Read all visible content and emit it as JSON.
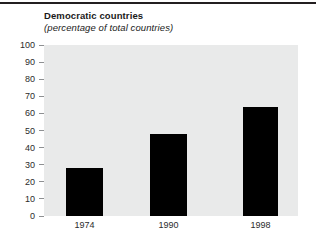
{
  "chart_data": {
    "type": "bar",
    "title": "Democratic countries",
    "subtitle": "(percentage of total countries)",
    "xlabel": "",
    "ylabel": "",
    "categories": [
      "1974",
      "1990",
      "1998"
    ],
    "values": [
      28,
      48,
      64
    ],
    "series": [
      {
        "name": "Democratic countries",
        "values": [
          28,
          48,
          64
        ]
      }
    ],
    "ylim": [
      0,
      100
    ],
    "yticks": [
      0,
      10,
      20,
      30,
      40,
      50,
      60,
      70,
      80,
      90,
      100
    ],
    "ytick_labels": [
      "0",
      "10",
      "20",
      "30",
      "40",
      "50",
      "60",
      "70",
      "80",
      "90",
      "100"
    ],
    "grid": false,
    "legend": "none",
    "colors": {
      "bar": "#000000",
      "plot_background": "#e9eaea",
      "page_background": "#ffffff",
      "rule": "#231f20",
      "text": "#1a1a1a",
      "tick_mark": "#8e9092"
    }
  }
}
